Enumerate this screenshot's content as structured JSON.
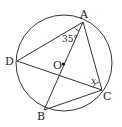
{
  "diagram": {
    "type": "circle-geometry",
    "circle": {
      "center_label": "O",
      "cx": 64,
      "cy": 63,
      "r": 48
    },
    "points": {
      "A": {
        "label": "A",
        "x": 83,
        "y": 18
      },
      "B": {
        "label": "B",
        "x": 44,
        "y": 108
      },
      "C": {
        "label": "C",
        "x": 102,
        "y": 90
      },
      "D": {
        "label": "D",
        "x": 17,
        "y": 61
      },
      "O": {
        "label": "O",
        "x": 63,
        "y": 65
      }
    },
    "segments": [
      "AD",
      "AC",
      "AB",
      "DC",
      "BC"
    ],
    "angles": {
      "DAB": {
        "label": "35°"
      },
      "ACD": {
        "label": "x"
      }
    },
    "colors": {
      "stroke": "#333333",
      "text": "#222222",
      "background": "#ffffff"
    }
  }
}
